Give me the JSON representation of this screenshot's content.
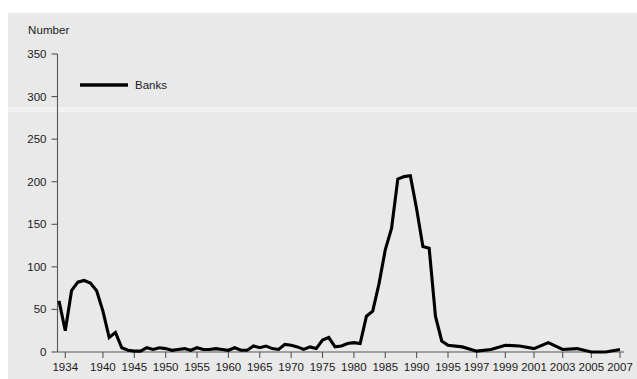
{
  "chart_data": {
    "type": "line",
    "title": "",
    "subtitle": "",
    "ylabel": "Number",
    "xlabel": "",
    "ylim": [
      0,
      350
    ],
    "yticks": [
      0,
      50,
      100,
      150,
      200,
      250,
      300,
      350
    ],
    "ytick_labels": [
      "0",
      "50",
      "100",
      "150",
      "200",
      "250",
      "300",
      "350"
    ],
    "xlim": [
      1933,
      2007
    ],
    "xtick_labels": [
      "1934",
      "1940",
      "1945",
      "1950",
      "1955",
      "1960",
      "1965",
      "1970",
      "1975",
      "1980",
      "1985",
      "1990",
      "1995",
      "1997",
      "1999",
      "2001",
      "2003",
      "2005",
      "2007"
    ],
    "xticks": [
      1934,
      1940,
      1945,
      1950,
      1955,
      1960,
      1965,
      1970,
      1975,
      1980,
      1985,
      1990,
      1995,
      1997,
      1999,
      2001,
      2003,
      2005,
      2007
    ],
    "grid": false,
    "legend_position": "upper-left",
    "legend": [
      "Banks"
    ],
    "series": [
      {
        "name": "Banks",
        "color": "#000000",
        "x": [
          1933,
          1934,
          1935,
          1936,
          1937,
          1938,
          1939,
          1940,
          1941,
          1942,
          1943,
          1944,
          1945,
          1946,
          1947,
          1948,
          1949,
          1950,
          1951,
          1952,
          1953,
          1954,
          1955,
          1956,
          1957,
          1958,
          1959,
          1960,
          1961,
          1962,
          1963,
          1964,
          1965,
          1966,
          1967,
          1968,
          1969,
          1970,
          1971,
          1972,
          1973,
          1974,
          1975,
          1976,
          1977,
          1978,
          1979,
          1980,
          1981,
          1982,
          1983,
          1984,
          1985,
          1986,
          1987,
          1988,
          1989,
          1990,
          1991,
          1992,
          1993,
          1994,
          1995,
          1996,
          1997,
          1998,
          1999,
          2000,
          2001,
          2002,
          2003,
          2004,
          2005,
          2006,
          2007
        ],
        "values": [
          60,
          25,
          72,
          82,
          84,
          81,
          72,
          48,
          17,
          23,
          5,
          2,
          1,
          1,
          5,
          3,
          5,
          4,
          2,
          3,
          4,
          2,
          5,
          3,
          3,
          4,
          3,
          2,
          5,
          2,
          2,
          7,
          5,
          7,
          4,
          3,
          9,
          8,
          6,
          3,
          6,
          4,
          14,
          17,
          6,
          7,
          10,
          11,
          10,
          42,
          48,
          80,
          120,
          145,
          203,
          206,
          207,
          168,
          124,
          122,
          42,
          13,
          8,
          6,
          1,
          3,
          8,
          7,
          4,
          11,
          3,
          4,
          0,
          0,
          3
        ]
      }
    ]
  },
  "axes": {
    "y_axis_title": "Number"
  },
  "legend": {
    "items": [
      {
        "label": "Banks",
        "color": "#000000"
      }
    ]
  }
}
